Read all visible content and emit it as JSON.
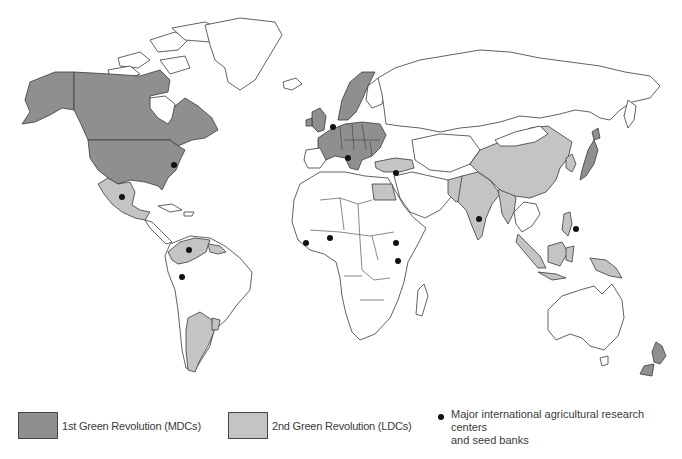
{
  "map": {
    "type": "world-choropleth",
    "categories": [
      {
        "id": "mdc",
        "label": "1st Green Revolution (MDCs)",
        "color": "#8f8f8f"
      },
      {
        "id": "ldc",
        "label": "2nd Green Revolution (LDCs)",
        "color": "#c4c4c4"
      },
      {
        "id": "none",
        "label": "",
        "color": "#ffffff"
      }
    ],
    "regions_mdc": [
      "United States",
      "Canada",
      "Western Europe",
      "Scandinavia (Norway, Sweden)",
      "United Kingdom",
      "Central/Eastern Europe",
      "Japan",
      "New Zealand"
    ],
    "regions_ldc": [
      "Mexico",
      "Colombia",
      "Venezuela",
      "Guyana/Suriname",
      "Argentina",
      "Uruguay",
      "Turkey",
      "Egypt",
      "China",
      "India",
      "Pakistan",
      "Bangladesh/Myanmar",
      "Korea",
      "Philippines",
      "Indonesia",
      "Malaysia",
      "Papua New Guinea"
    ],
    "research_centers": [
      {
        "location": "Eastern United States",
        "x": 174,
        "y": 165
      },
      {
        "location": "Mexico",
        "x": 122,
        "y": 197
      },
      {
        "location": "Colombia (north)",
        "x": 189,
        "y": 250
      },
      {
        "location": "Colombia/Peru",
        "x": 182,
        "y": 277
      },
      {
        "location": "Netherlands",
        "x": 333,
        "y": 127
      },
      {
        "location": "Italy",
        "x": 348,
        "y": 158
      },
      {
        "location": "Syria/Lebanon",
        "x": 396,
        "y": 173
      },
      {
        "location": "Sierra Leone/Liberia",
        "x": 306,
        "y": 243
      },
      {
        "location": "Nigeria",
        "x": 330,
        "y": 238
      },
      {
        "location": "Ethiopia",
        "x": 396,
        "y": 243
      },
      {
        "location": "Kenya",
        "x": 398,
        "y": 261
      },
      {
        "location": "India",
        "x": 479,
        "y": 219
      },
      {
        "location": "Philippines",
        "x": 576,
        "y": 229
      }
    ]
  },
  "legend": {
    "mdc_label": "1st Green Revolution (MDCs)",
    "ldc_label": "2nd Green Revolution (LDCs)",
    "dot_label_line1": "Major international agricultural research centers",
    "dot_label_line2": "and seed banks"
  }
}
